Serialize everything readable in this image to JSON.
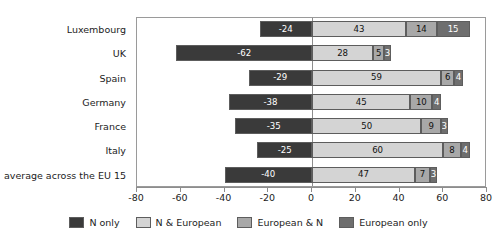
{
  "chart_data": {
    "type": "bar",
    "title": "",
    "subtitle": "",
    "xlabel": "",
    "ylabel": "",
    "orientation": "horizontal",
    "stacked": true,
    "diverging": true,
    "grid": false,
    "legend_position": "bottom",
    "xlim": [
      -80,
      80
    ],
    "xticks": [
      -80,
      -60,
      -40,
      -20,
      0,
      20,
      40,
      60,
      80
    ],
    "xtick_labels": [
      "-80",
      "-60",
      "-40",
      "-20",
      "0",
      "20",
      "40",
      "60",
      "80"
    ],
    "categories": [
      "Luxembourg",
      "UK",
      "Spain",
      "Germany",
      "France",
      "Italy",
      "average across the EU 15"
    ],
    "series": [
      {
        "name": "N only",
        "color": "#3a3a3a",
        "values": [
          -24,
          -62,
          -29,
          -38,
          -35,
          -25,
          -40
        ],
        "labels": [
          "-24",
          "-62",
          "-29",
          "-38",
          "-35",
          "-25",
          "-40"
        ]
      },
      {
        "name": "N & European",
        "color": "#d4d4d4",
        "values": [
          43,
          28,
          59,
          45,
          50,
          60,
          47
        ],
        "labels": [
          "43",
          "28",
          "59",
          "45",
          "50",
          "60",
          "47"
        ]
      },
      {
        "name": "European & N",
        "color": "#a8a8a8",
        "values": [
          14,
          5,
          6,
          10,
          9,
          8,
          7
        ],
        "labels": [
          "14",
          "5",
          "6",
          "10",
          "9",
          "8",
          "7"
        ]
      },
      {
        "name": "European only",
        "color": "#6e6e6e",
        "values": [
          15,
          3,
          4,
          4,
          3,
          4,
          3
        ],
        "labels": [
          "15",
          "3",
          "4",
          "4",
          "3",
          "4",
          "3"
        ]
      }
    ]
  }
}
